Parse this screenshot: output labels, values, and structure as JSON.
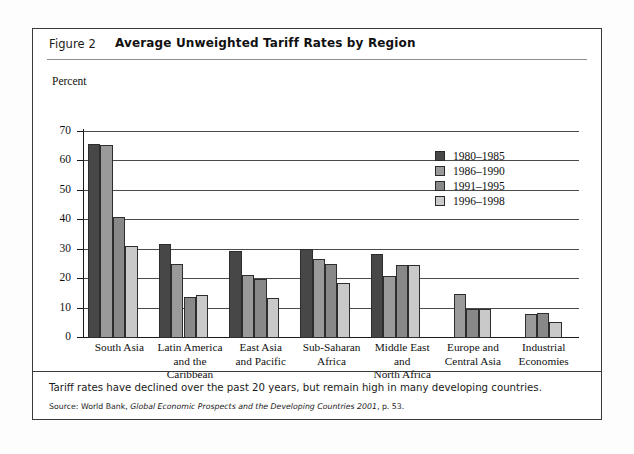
{
  "figure": {
    "label": "Figure 2",
    "title": "Average Unweighted Tariff Rates by Region",
    "caption": "Tariff rates have declined over the past 20 years, but remain high in many developing countries.",
    "source_prefix": "Source: World Bank, ",
    "source_italic": "Global Economic Prospects and the Developing Countries 2001",
    "source_suffix": ", p. 53."
  },
  "chart_data": {
    "type": "bar",
    "title": "Average Unweighted Tariff Rates by Region",
    "xlabel": "",
    "ylabel": "Percent",
    "ylim": [
      0,
      70
    ],
    "ytick_step": 10,
    "yticks": [
      0,
      10,
      20,
      30,
      40,
      50,
      60,
      70
    ],
    "grid": true,
    "legend_position": "upper-right-inside",
    "categories": [
      "South Asia",
      "Latin America and the Caribbean",
      "East Asia and Pacific",
      "Sub-Saharan Africa",
      "Middle East and North Africa",
      "Europe and Central Asia",
      "Industrial Economies"
    ],
    "category_lines": [
      [
        "South Asia"
      ],
      [
        "Latin America",
        "and the",
        "Caribbean"
      ],
      [
        "East Asia",
        "and Pacific"
      ],
      [
        "Sub-Saharan",
        "Africa"
      ],
      [
        "Middle East",
        "and",
        "North Africa"
      ],
      [
        "Europe and",
        "Central Asia"
      ],
      [
        "Industrial",
        "Economies"
      ]
    ],
    "series": [
      {
        "name": "1980–1985",
        "color": "#474747",
        "values": [
          66.0,
          32.0,
          29.5,
          30.3,
          28.6,
          null,
          null
        ]
      },
      {
        "name": "1986–1990",
        "color": "#9a9a9a",
        "values": [
          65.5,
          25.0,
          21.5,
          26.8,
          21.0,
          15.0,
          8.2
        ]
      },
      {
        "name": "1991–1995",
        "color": "#888888",
        "values": [
          41.0,
          14.0,
          20.1,
          25.3,
          24.7,
          10.0,
          8.6
        ]
      },
      {
        "name": "1996–1998",
        "color": "#c9c9c9",
        "values": [
          31.4,
          14.5,
          13.5,
          18.6,
          24.8,
          10.0,
          5.6
        ]
      }
    ]
  }
}
